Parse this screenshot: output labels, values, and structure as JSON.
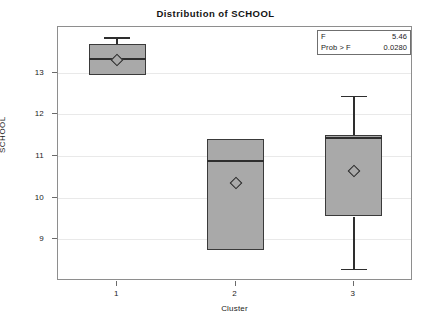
{
  "chart_data": {
    "type": "box",
    "title": "Distribution of SCHOOL",
    "xlabel": "Cluster",
    "ylabel": "SCHOOL",
    "categories": [
      "1",
      "2",
      "3"
    ],
    "ylim": [
      8.0,
      14.1
    ],
    "yticks": [
      13,
      12,
      11,
      10,
      9
    ],
    "grid": true,
    "legend": "none",
    "boxes": [
      {
        "category": "1",
        "whisker_low": 12.95,
        "q1": 12.95,
        "median": 13.35,
        "q3": 13.7,
        "whisker_high": 13.85,
        "mean": 13.3
      },
      {
        "category": "2",
        "whisker_low": 8.75,
        "q1": 8.75,
        "median": 10.9,
        "q3": 11.4,
        "whisker_high": 11.4,
        "mean": 10.35
      },
      {
        "category": "3",
        "whisker_low": 8.3,
        "q1": 9.55,
        "median": 11.45,
        "q3": 11.5,
        "whisker_high": 12.45,
        "mean": 10.65
      }
    ],
    "annotations": {
      "f_label": "F",
      "f_value": "5.46",
      "prob_label": "Prob > F",
      "prob_value": "0.0280"
    }
  }
}
